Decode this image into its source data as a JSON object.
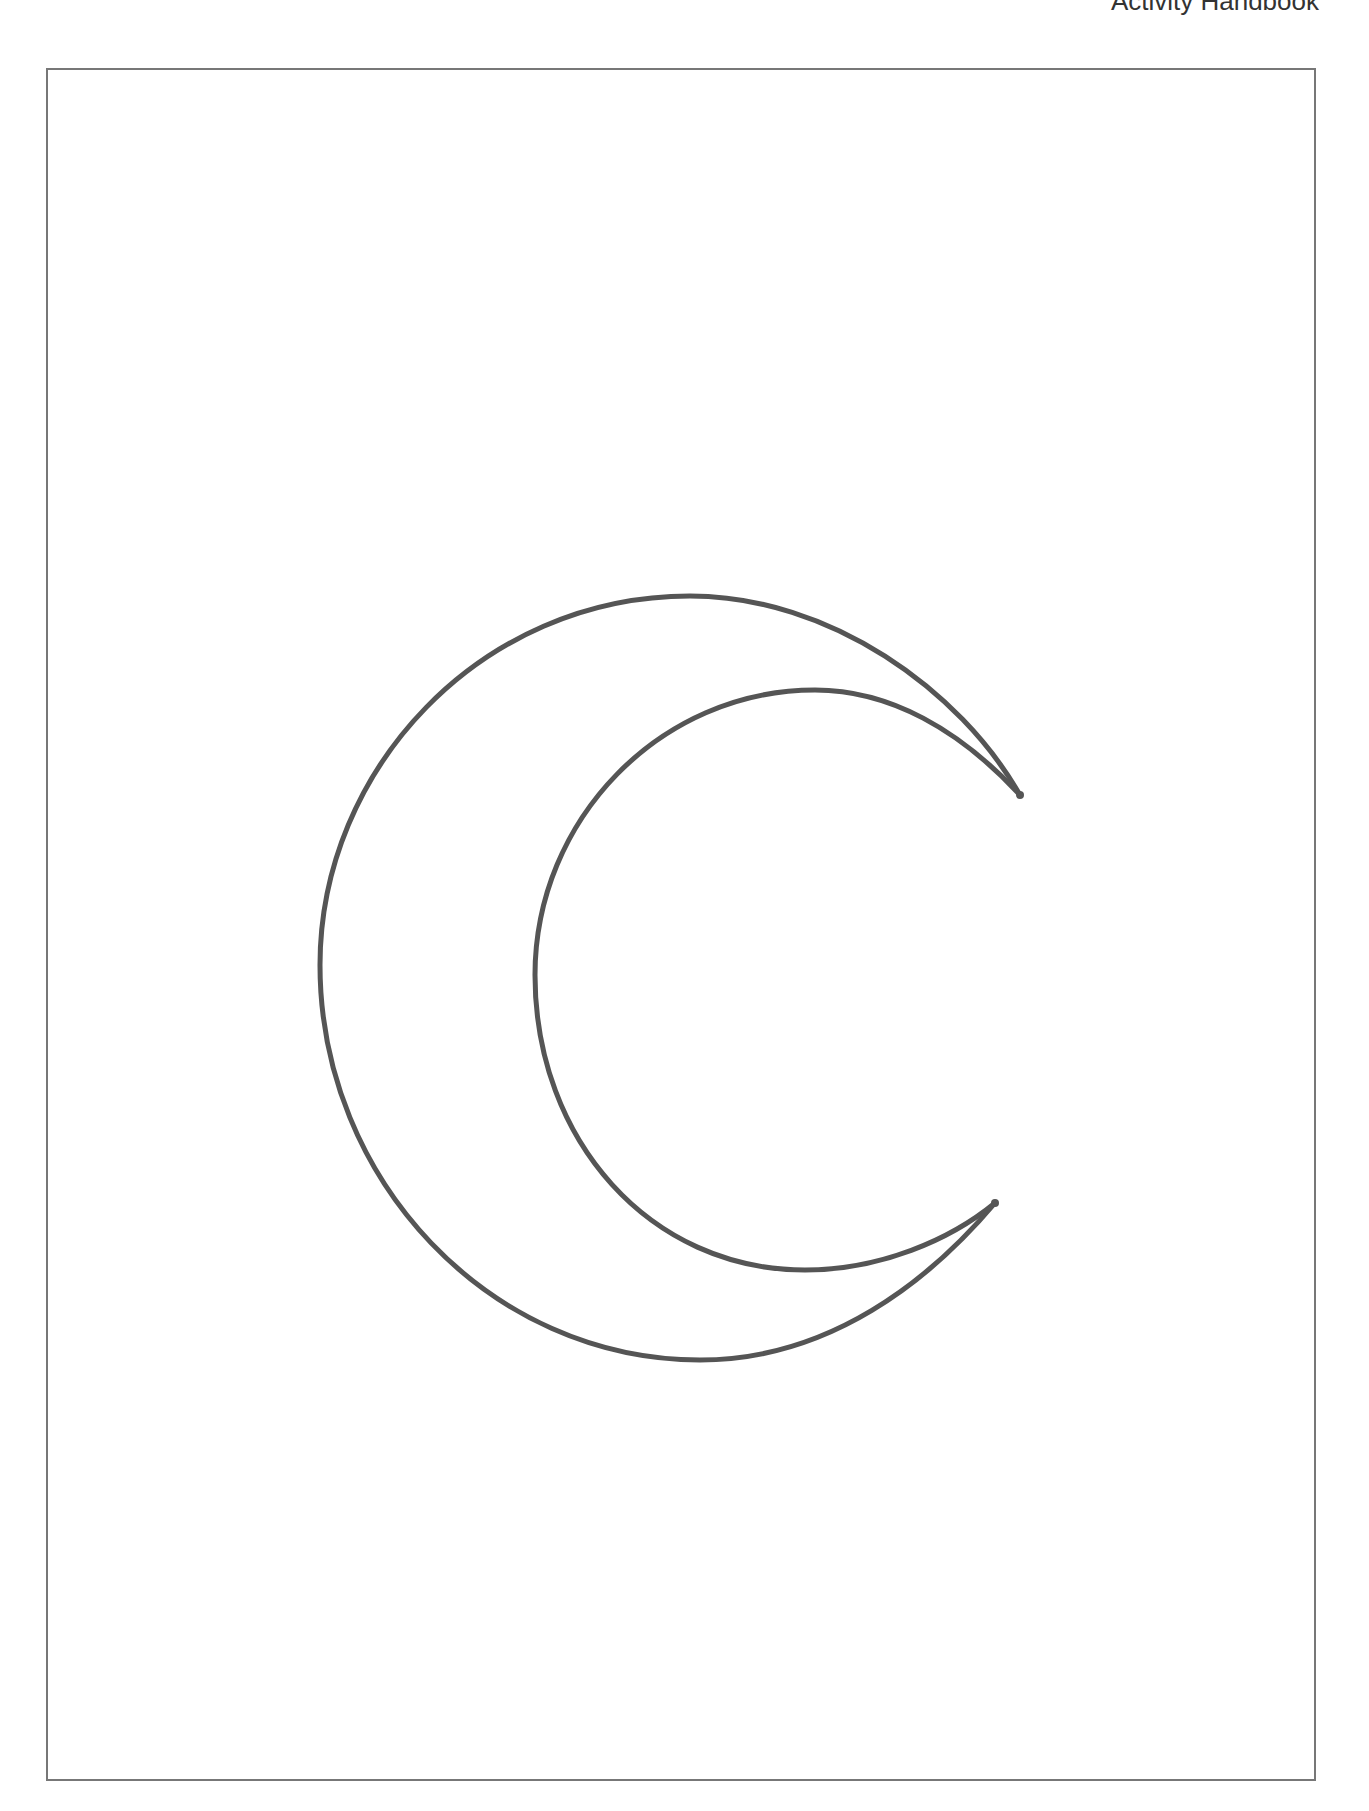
{
  "header": {
    "running_title": "Activity Handbook"
  },
  "figure": {
    "shape": "crescent-moon",
    "stroke_color": "#555555",
    "frame_color": "#777777",
    "icon": "crescent-moon-icon"
  }
}
